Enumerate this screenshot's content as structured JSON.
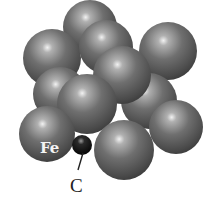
{
  "diagram": {
    "labels": {
      "iron": "Fe",
      "carbon": "C"
    },
    "colors": {
      "iron_atom": "#6e6e6e",
      "iron_highlight": "#e6e6e6",
      "iron_shadow": "#3a3a3a",
      "carbon_atom": "#111111",
      "background": "#ffffff"
    },
    "atoms": [
      {
        "element": "Fe",
        "cx": 90,
        "cy": 27,
        "r": 27
      },
      {
        "element": "Fe",
        "cx": 168,
        "cy": 51,
        "r": 29
      },
      {
        "element": "Fe",
        "cx": 52,
        "cy": 58,
        "r": 29
      },
      {
        "element": "Fe",
        "cx": 106,
        "cy": 47,
        "r": 27
      },
      {
        "element": "Fe",
        "cx": 60,
        "cy": 94,
        "r": 27
      },
      {
        "element": "Fe",
        "cx": 149,
        "cy": 101,
        "r": 28
      },
      {
        "element": "Fe",
        "cx": 122,
        "cy": 75,
        "r": 29
      },
      {
        "element": "Fe",
        "cx": 176,
        "cy": 127,
        "r": 27
      },
      {
        "element": "Fe",
        "cx": 87,
        "cy": 104,
        "r": 30
      },
      {
        "element": "Fe",
        "cx": 47,
        "cy": 134,
        "r": 28
      },
      {
        "element": "C",
        "cx": 82,
        "cy": 145,
        "r": 10
      },
      {
        "element": "Fe",
        "cx": 124,
        "cy": 150,
        "r": 30
      }
    ]
  }
}
